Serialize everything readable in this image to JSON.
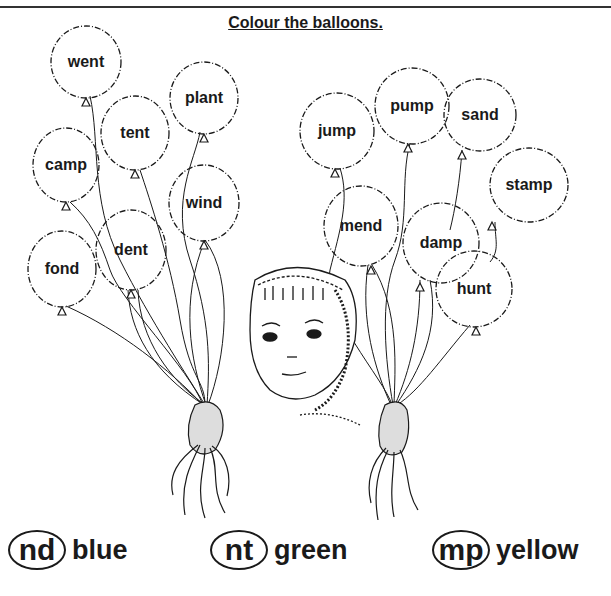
{
  "title": "Colour the balloons.",
  "balloons": [
    {
      "word": "went",
      "x": 86,
      "y": 62
    },
    {
      "word": "plant",
      "x": 204,
      "y": 98
    },
    {
      "word": "tent",
      "x": 135,
      "y": 133
    },
    {
      "word": "camp",
      "x": 66,
      "y": 165
    },
    {
      "word": "wind",
      "x": 204,
      "y": 203
    },
    {
      "word": "dent",
      "x": 131,
      "y": 250
    },
    {
      "word": "fond",
      "x": 62,
      "y": 269
    },
    {
      "word": "jump",
      "x": 337,
      "y": 131
    },
    {
      "word": "pump",
      "x": 412,
      "y": 106
    },
    {
      "word": "sand",
      "x": 480,
      "y": 115
    },
    {
      "word": "stamp",
      "x": 529,
      "y": 185
    },
    {
      "word": "mend",
      "x": 361,
      "y": 226
    },
    {
      "word": "damp",
      "x": 441,
      "y": 243
    },
    {
      "word": "hunt",
      "x": 474,
      "y": 289
    }
  ],
  "key": [
    {
      "ending": "nd",
      "color": "blue"
    },
    {
      "ending": "nt",
      "color": "green"
    },
    {
      "ending": "mp",
      "color": "yellow"
    }
  ]
}
